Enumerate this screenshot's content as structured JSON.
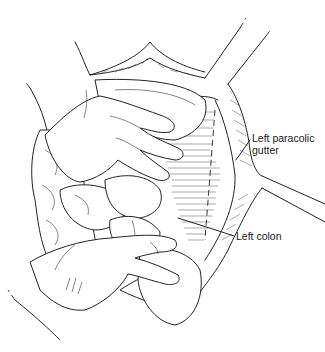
{
  "figure": {
    "type": "surgical line illustration",
    "background_color": "#ffffff",
    "line_color": "#222222"
  },
  "labels": [
    {
      "id": "left-paracolic-gutter",
      "text_line1": "Left paracolic",
      "text_line2": "gutter"
    },
    {
      "id": "left-colon",
      "text": "Left colon"
    }
  ]
}
